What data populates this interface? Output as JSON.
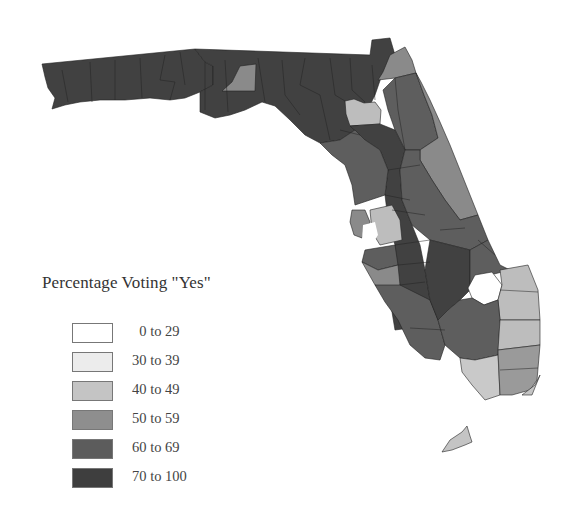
{
  "legend": {
    "title": "Percentage Voting \"Yes\"",
    "items": [
      {
        "label": "  0 to 29",
        "color": "#ffffff"
      },
      {
        "label": "30 to 39",
        "color": "#ececec"
      },
      {
        "label": "40 to 49",
        "color": "#c4c4c4"
      },
      {
        "label": "50 to 59",
        "color": "#8e8e8e"
      },
      {
        "label": "60 to 69",
        "color": "#5c5c5c"
      },
      {
        "label": "70 to 100",
        "color": "#3e3e3e"
      }
    ]
  },
  "map": {
    "region": "Florida counties",
    "colors": {
      "c70": "#414141",
      "c60": "#5e5e5e",
      "c50": "#8a8a8a",
      "c40": "#bdbdbd",
      "c30": "#e3e3e3",
      "c0": "#ffffff",
      "border": "#222222",
      "water": "#ffffff"
    }
  }
}
